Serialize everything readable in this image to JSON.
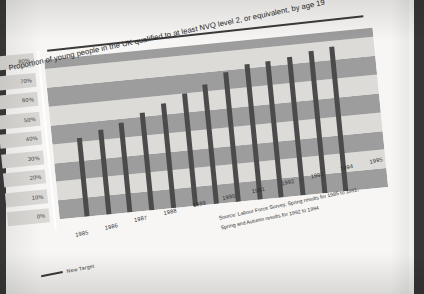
{
  "chart_data": {
    "type": "bar",
    "title": "Proportion of young people in the UK qualified to at least NVQ level 2, or equivalent, by age 19",
    "xlabel": "",
    "ylabel": "",
    "ylim": [
      0,
      85
    ],
    "grid": true,
    "legend_position": "bottom-left",
    "categories": [
      "1985",
      "1986",
      "1987",
      "1988",
      "1989",
      "1990",
      "1991",
      "1992",
      "1993",
      "1994",
      "1995"
    ],
    "tick_labels_y": [
      "80%",
      "70%",
      "60%",
      "50%",
      "40%",
      "30%",
      "20%",
      "10%",
      "0%"
    ],
    "bars": [
      {
        "year": "1985",
        "value": 42
      },
      {
        "year": "1986",
        "value": 45
      },
      {
        "year": "1987",
        "value": 48
      },
      {
        "year": "1988",
        "value": 52
      },
      {
        "year": "1989",
        "value": 56
      },
      {
        "year": "1990",
        "value": 60
      },
      {
        "year": "1991",
        "value": 64
      },
      {
        "year": "1992",
        "value": 69
      },
      {
        "year": "1992",
        "value": 72
      },
      {
        "year": "1993",
        "value": 73
      },
      {
        "year": "1993",
        "value": 74
      },
      {
        "year": "1994",
        "value": 76
      },
      {
        "year": "1994",
        "value": 77
      }
    ],
    "target_line": {
      "label": "New Target",
      "value": 85
    },
    "annotations": [
      "Source: Labour Force Survey, Spring results for 1985 to 1991,",
      "Spring and Autumn results for 1992 to 1994"
    ],
    "colors": {
      "bar": "#4b4b4b",
      "band_dark": "#9d9d9d",
      "band_light": "#dcdbd8",
      "target_line": "#3b3b3b",
      "paper": "#f7f6f4",
      "text": "#2f2f2f"
    }
  },
  "legend": {
    "target_label": "New Target"
  },
  "source_lines": {
    "line1": "Source: Labour Force Survey, Spring results for 1985 to 1991,",
    "line2": "Spring and Autumn results for 1992 to 1994"
  }
}
